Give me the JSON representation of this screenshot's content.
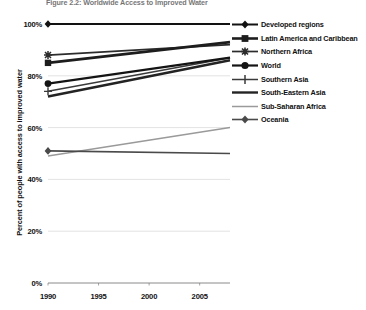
{
  "figure": {
    "title": "Figure 2.2: Worldwide Access to Improved Water"
  },
  "axes": {
    "y_title": "Percent of people with access to improved water",
    "y_ticks": [
      "0%",
      "20%",
      "40%",
      "60%",
      "80%",
      "100%"
    ],
    "x_ticks": [
      "1990",
      "1995",
      "2000",
      "2005"
    ]
  },
  "legend": {
    "items": [
      {
        "label": "Developed regions",
        "marker": "diamond-marker",
        "color": "#121212",
        "width": 2.0
      },
      {
        "label": "Latin America and Caribbean",
        "marker": "square-marker",
        "color": "#1d1d1d",
        "width": 2.6
      },
      {
        "label": "Northern Africa",
        "marker": "star-marker",
        "color": "#2c2c2c",
        "width": 1.7
      },
      {
        "label": "World",
        "marker": "circle-marker",
        "color": "#141414",
        "width": 2.2
      },
      {
        "label": "Southern Asia",
        "marker": "plus-marker",
        "color": "#3a3a3a",
        "width": 1.5
      },
      {
        "label": "South-Eastern Asia",
        "marker": "line-marker",
        "color": "#232323",
        "width": 2.4
      },
      {
        "label": "Sub-Saharan Africa",
        "marker": "thin-line-marker",
        "color": "#9a9a9a",
        "width": 1.5
      },
      {
        "label": "Oceania",
        "marker": "diamond-marker",
        "color": "#4a4a4a",
        "width": 1.6
      }
    ]
  },
  "chart_data": {
    "type": "line",
    "title": "Figure 2.2: Worldwide Access to Improved Water",
    "xlabel": "",
    "ylabel": "Percent of people with access to improved water",
    "xlim": [
      1990,
      2008
    ],
    "ylim": [
      0,
      100
    ],
    "x": [
      1990,
      2008
    ],
    "grid": true,
    "legend_position": "right",
    "series": [
      {
        "name": "Developed regions",
        "values": [
          100,
          100
        ],
        "color": "#121212"
      },
      {
        "name": "Latin America and Caribbean",
        "values": [
          85,
          93
        ],
        "color": "#1d1d1d"
      },
      {
        "name": "Northern Africa",
        "values": [
          88,
          92
        ],
        "color": "#2c2c2c"
      },
      {
        "name": "World",
        "values": [
          77,
          87
        ],
        "color": "#141414"
      },
      {
        "name": "Southern Asia",
        "values": [
          74,
          87
        ],
        "color": "#3a3a3a"
      },
      {
        "name": "South-Eastern Asia",
        "values": [
          72,
          86
        ],
        "color": "#232323"
      },
      {
        "name": "Sub-Saharan Africa",
        "values": [
          49,
          60
        ],
        "color": "#9a9a9a"
      },
      {
        "name": "Oceania",
        "values": [
          51,
          50
        ],
        "color": "#4a4a4a"
      }
    ]
  }
}
